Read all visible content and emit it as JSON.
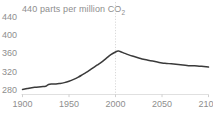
{
  "chart_data": {
    "type": "line",
    "title": "440 parts per million CO2",
    "title_main": "440 parts per million CO",
    "title_subscript": "2",
    "xlabel": "",
    "ylabel": "",
    "xlim": [
      1900,
      2100
    ],
    "ylim": [
      272,
      448
    ],
    "xticks": [
      1900,
      1950,
      2000,
      2050,
      2100
    ],
    "yticks": [
      280,
      320,
      360,
      400,
      440
    ],
    "xtick_labels": [
      "1900",
      "1950",
      "2000",
      "2050",
      "2100"
    ],
    "ytick_labels": [
      "280",
      "320",
      "360",
      "400",
      "440"
    ],
    "grid": false,
    "vertical_gridline": 2000,
    "vertical_gridline_style": "dotted",
    "legend": null,
    "line_color": "#3a3a3a",
    "axis_color": "#d8d8d8",
    "label_color": "#8e8e8e",
    "background_color": "#ffffff",
    "series": [
      {
        "name": "CO2 concentration",
        "x": [
          1900,
          1905,
          1910,
          1915,
          1920,
          1925,
          1928,
          1932,
          1936,
          1940,
          1945,
          1950,
          1955,
          1960,
          1965,
          1970,
          1975,
          1980,
          1985,
          1990,
          1995,
          2000,
          2003,
          2005,
          2010,
          2015,
          2020,
          2025,
          2030,
          2035,
          2040,
          2045,
          2050,
          2055,
          2060,
          2065,
          2070,
          2075,
          2080,
          2085,
          2090,
          2095,
          2100
        ],
        "y": [
          283,
          285,
          287,
          288,
          289,
          290,
          294,
          295,
          295,
          296,
          298,
          301,
          305,
          310,
          316,
          322,
          329,
          336,
          343,
          351,
          359,
          365,
          367,
          366,
          362,
          358,
          355,
          352,
          349,
          347,
          345,
          343,
          341,
          340,
          339,
          338,
          337,
          336,
          335,
          335,
          334,
          333,
          332
        ]
      }
    ]
  }
}
